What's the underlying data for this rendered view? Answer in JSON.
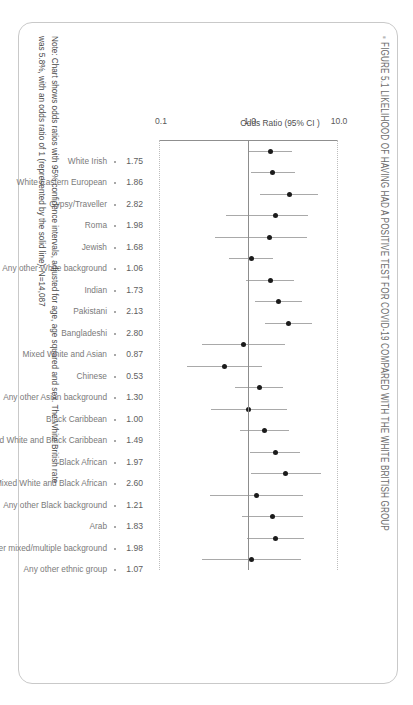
{
  "figure": {
    "title": "FIGURE 5.1 LIKELIHOOD OF HAVING HAD A POSITIVE TEST FOR COVID-19 COMPARED WITH THE WHITE BRITISH GROUP",
    "title_bullet": "▪",
    "note_line1": "Note: Chart shows odds ratios with 95% confidence intervals, adjusted for age, age squared and sex. The White British rate",
    "note_line2": "was 5.8%, with an odds ratio of 1 (represented by the solid line). N=14,087"
  },
  "chart_data": {
    "type": "scatter",
    "title": "FIGURE 5.1 LIKELIHOOD OF HAVING HAD A POSITIVE TEST FOR COVID-19 COMPARED WITH THE WHITE BRITISH GROUP",
    "xlabel": "Odds Ratio (95% CI )",
    "ylabel": "",
    "orientation": "horizontal-forest-plot",
    "scale": "log",
    "xlim": [
      0.1,
      10.0
    ],
    "ticks": [
      "0.1",
      "1.0",
      "10.0"
    ],
    "tick_values": [
      0.1,
      1.0,
      10.0
    ],
    "grid": "dotted at 0.1 and 10.0; solid reference line at 1.0",
    "reference_line": 1.0,
    "categories": [
      "White Irish",
      "White Eastern European",
      "Gypsy/Traveller",
      "Roma",
      "Jewish",
      "Any other White background",
      "Indian",
      "Pakistani",
      "Bangladeshi",
      "Mixed White and Asian",
      "Chinese",
      "Any other Asian background",
      "Black Caribbean",
      "Mixed White and Black Caribbean",
      "Black African",
      "Mixed White and Black African",
      "Any other Black background",
      "Arab",
      "Any other mixed/multiple background",
      "Any other ethnic group"
    ],
    "values": [
      1.75,
      1.86,
      2.82,
      1.98,
      1.68,
      1.06,
      1.73,
      2.13,
      2.8,
      0.87,
      0.53,
      1.3,
      1.0,
      1.49,
      1.97,
      2.6,
      1.21,
      1.83,
      1.98,
      1.07
    ],
    "ci_low": [
      1.0,
      1.05,
      1.32,
      0.55,
      0.42,
      0.6,
      0.93,
      1.16,
      1.53,
      0.3,
      0.2,
      0.7,
      0.37,
      0.8,
      1.03,
      1.05,
      0.36,
      0.83,
      0.95,
      0.3
    ],
    "ci_high": [
      3.05,
      3.28,
      6.02,
      4.6,
      4.45,
      1.88,
      3.2,
      3.9,
      5.1,
      2.55,
      1.4,
      2.4,
      2.7,
      2.78,
      3.75,
      6.45,
      4.05,
      4.05,
      4.12,
      3.8
    ],
    "value_labels": [
      "1.75",
      "1.86",
      "2.82",
      "1.98",
      "1.68",
      "1.06",
      "1.73",
      "2.13",
      "2.80",
      "0.87",
      "0.53",
      "1.30",
      "1.00",
      "1.49",
      "1.97",
      "2.60",
      "1.21",
      "1.83",
      "1.98",
      "1.07"
    ],
    "note": "Chart shows odds ratios with 95% confidence intervals, adjusted for age, age squared and sex. The White British rate was 5.8%, with an odds ratio of 1 (represented by the solid line). N=14,087",
    "colors": {
      "point": "#1b1b1b",
      "ci": "#a9a9a9",
      "axis": "#8d8d8d",
      "dotted": "#bdbdbd",
      "label": "#7a7a7a",
      "value": "#5e5e5e"
    }
  }
}
